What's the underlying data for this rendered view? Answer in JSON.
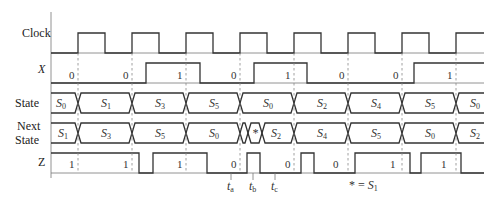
{
  "signals": {
    "clock": "Clock",
    "x": "X",
    "state": "State",
    "next_state_line1": "Next",
    "next_state_line2": "State",
    "z": "Z"
  },
  "x_values": [
    "0",
    "0",
    "1",
    "0",
    "1",
    "0",
    "0",
    "1"
  ],
  "state_values": [
    {
      "base": "S",
      "sub": "0"
    },
    {
      "base": "S",
      "sub": "1"
    },
    {
      "base": "S",
      "sub": "3"
    },
    {
      "base": "S",
      "sub": "5"
    },
    {
      "base": "S",
      "sub": "0"
    },
    {
      "base": "S",
      "sub": "2"
    },
    {
      "base": "S",
      "sub": "4"
    },
    {
      "base": "S",
      "sub": "5"
    },
    {
      "base": "S",
      "sub": "0"
    }
  ],
  "next_state_values": [
    {
      "base": "S",
      "sub": "1"
    },
    {
      "base": "S",
      "sub": "3"
    },
    {
      "base": "S",
      "sub": "5"
    },
    {
      "base": "S",
      "sub": "0"
    },
    {
      "base": "*",
      "sub": ""
    },
    {
      "base": "S",
      "sub": "2"
    },
    {
      "base": "S",
      "sub": "4"
    },
    {
      "base": "S",
      "sub": "5"
    },
    {
      "base": "S",
      "sub": "0"
    },
    {
      "base": "S",
      "sub": "2"
    }
  ],
  "z_values": [
    "1",
    "1",
    "1",
    "0",
    "0",
    "0",
    "1",
    "1"
  ],
  "time_markers": [
    {
      "base": "t",
      "sub": "a"
    },
    {
      "base": "t",
      "sub": "b"
    },
    {
      "base": "t",
      "sub": "c"
    }
  ],
  "footnote": {
    "lhs": "* = ",
    "base": "S",
    "sub": "1"
  }
}
